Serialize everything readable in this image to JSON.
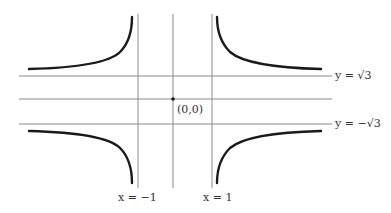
{
  "diagram": {
    "type": "function graph sketch",
    "asymptotes": {
      "vertical": [
        {
          "equation": "x = −1",
          "value": -1
        },
        {
          "equation": "x = 1",
          "value": 1
        }
      ],
      "horizontal": [
        {
          "equation": "y = √3",
          "value": 1.732
        },
        {
          "equation": "y = −√3",
          "value": -1.732
        }
      ]
    },
    "labels": {
      "origin": "(0,0)",
      "x_neg_one": "x = −1",
      "x_one": "x = 1",
      "y_sqrt3": "y = √3",
      "y_neg_sqrt3": "y = −√3"
    },
    "branches": [
      "upper-left: approaches y=√3 as x→−∞, rises to +∞ as x→−1⁻",
      "upper-right: descends from +∞ as x→1⁺, approaches y=√3 as x→+∞",
      "lower-left: approaches y=−√3 as x→−∞, falls to −∞ as x→−1⁻",
      "lower-right: rises from −∞ as x→1⁺, approaches y=−√3 as x→+∞"
    ],
    "colors": {
      "curve": "#1a1a1a",
      "axis": "#8a8a8a",
      "text": "#333333"
    }
  }
}
